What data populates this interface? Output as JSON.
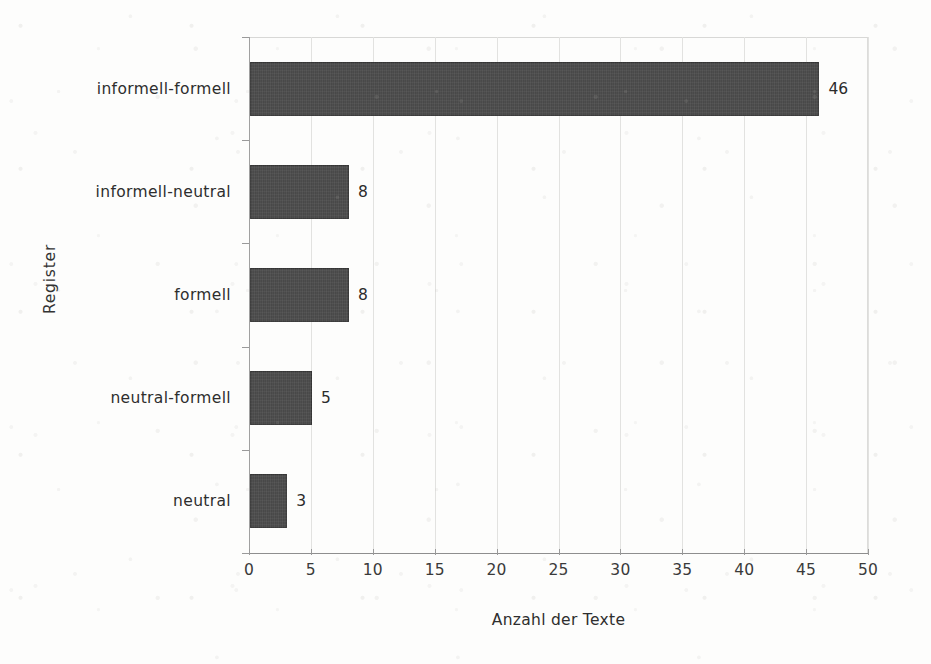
{
  "chart_data": {
    "type": "bar",
    "orientation": "horizontal",
    "title": "",
    "subtitle": "",
    "xlabel": "Anzahl der Texte",
    "ylabel": "Register",
    "categories": [
      "informell-formell",
      "informell-neutral",
      "formell",
      "neutral-formell",
      "neutral"
    ],
    "values": [
      46,
      8,
      8,
      5,
      3
    ],
    "data_labels": [
      "46",
      "8",
      "8",
      "5",
      "3"
    ],
    "xlim": [
      0,
      50
    ],
    "xticks": [
      0,
      5,
      10,
      15,
      20,
      25,
      30,
      35,
      40,
      45,
      50
    ],
    "xtick_labels": [
      "0",
      "5",
      "10",
      "15",
      "20",
      "25",
      "30",
      "35",
      "40",
      "45",
      "50"
    ],
    "grid": "vertical",
    "legend": "none",
    "bar_color": "#4d4d4d",
    "background_color": "#fdfdfc",
    "gridline_color": "#e2e2e0",
    "axis_color": "#8e8e8e",
    "text_color": "#2b2b2b"
  }
}
